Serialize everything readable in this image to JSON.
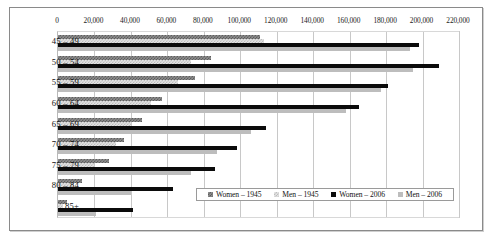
{
  "chart_data": {
    "type": "bar",
    "orientation": "horizontal",
    "title": "",
    "xlabel": "",
    "ylabel": "",
    "xlim": [
      0,
      220000
    ],
    "xticks": [
      0,
      20000,
      40000,
      60000,
      80000,
      100000,
      120000,
      140000,
      160000,
      180000,
      200000,
      220000
    ],
    "xtick_labels": [
      "0",
      "20,000",
      "40,000",
      "60,000",
      "80,000",
      "100,000",
      "120,000",
      "140,000",
      "160,000",
      "180,000",
      "200,000",
      "220,000"
    ],
    "categories": [
      "45 – 49",
      "50 – 54",
      "55 – 59",
      "60 – 64",
      "65 – 69",
      "70 – 74",
      "75 – 79",
      "80 – 84",
      "85+"
    ],
    "grid": true,
    "legend_position": "bottom-right",
    "series": [
      {
        "name": "Women – 1945",
        "color": "#6e6e6e",
        "pattern": "checker-dark",
        "values": [
          111000,
          84000,
          75000,
          57000,
          46000,
          36000,
          28000,
          13000,
          5000
        ]
      },
      {
        "name": "Men – 1945",
        "color": "#e0e0e0",
        "pattern": "checker-light",
        "values": [
          113000,
          73000,
          66000,
          51000,
          40000,
          32000,
          20000,
          9000,
          3000
        ]
      },
      {
        "name": "Women – 2006",
        "color": "#0b0b0b",
        "pattern": "solid",
        "values": [
          198000,
          209000,
          181000,
          165000,
          114000,
          98000,
          86000,
          63000,
          41000
        ]
      },
      {
        "name": "Men – 2006",
        "color": "#bdbdbd",
        "pattern": "solid",
        "values": [
          193000,
          195000,
          177000,
          158000,
          106000,
          87000,
          73000,
          40000,
          21000
        ]
      }
    ]
  },
  "legend": {
    "entries": [
      {
        "label": "Women – 1945"
      },
      {
        "label": "Men – 1945"
      },
      {
        "label": "Women – 2006"
      },
      {
        "label": "Men – 2006"
      }
    ]
  }
}
